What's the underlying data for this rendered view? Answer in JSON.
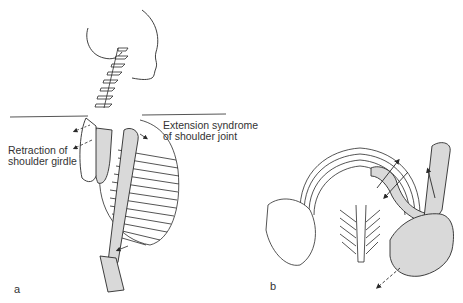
{
  "figure": {
    "panels": [
      {
        "id": "a",
        "letter": "a",
        "view": "lateral skeleton of head, neck, thorax and arm",
        "annotations": {
          "left_label": {
            "line1": "Retraction of",
            "line2": "shoulder girdle"
          },
          "right_label": {
            "line1": "Extension syndrome",
            "line2": "of shoulder joint"
          }
        }
      },
      {
        "id": "b",
        "letter": "b",
        "view": "superior view of thorax and shoulder girdle"
      }
    ],
    "colors": {
      "line": "#2a2a2a",
      "shade": "#d9d9d9",
      "background": "#ffffff"
    }
  }
}
